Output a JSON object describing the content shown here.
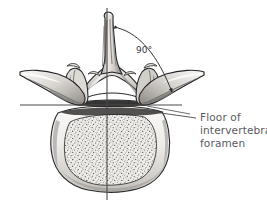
{
  "figure": {
    "background_color": "#ffffff",
    "width": 267,
    "height": 215
  },
  "annotations": {
    "angle_label": "90°",
    "callout_line_1": "Floor of",
    "callout_line_2": "intervertebral",
    "callout_line_3": "foramen",
    "callout_color": "#5a5a60",
    "angle_color": "#3a3a3e",
    "line_color": "#4a4a4a"
  },
  "anatomy": {
    "spinous_process": "spinous-process",
    "transverse_process_left": "transverse-process-left",
    "transverse_process_right": "transverse-process-right",
    "superior_articular_process_left": "superior-articular-process-left",
    "superior_articular_process_right": "superior-articular-process-right",
    "lamina": "lamina",
    "vertebral_body": "vertebral-body",
    "vertebral_foramen": "vertebral-foramen",
    "trabecular_bone": "trabecular-bone-stipple"
  },
  "reference_lines": {
    "vertical_axis": "vertical-midline-axis",
    "horizontal_axis": "horizontal-reference-line",
    "angle_arc": "ninety-degree-arc",
    "leader_line": "callout-leader-line"
  },
  "colors": {
    "bone_light": "#f2f0ee",
    "bone_mid": "#c9c6c2",
    "bone_dark": "#6e6b68",
    "outline": "#2a2a2a",
    "shadow": "#8d8a86"
  }
}
